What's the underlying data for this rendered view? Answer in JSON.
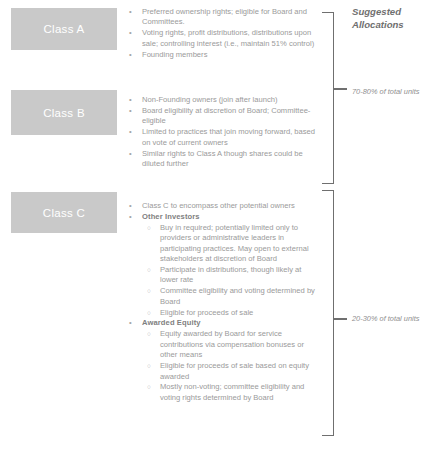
{
  "slide": {
    "title": "Equity Class Structure",
    "accent_color": "#c9c9c9",
    "text_color": "#9a9a9a",
    "bracket_color": "#6f6f6f"
  },
  "classes": [
    {
      "id": "class-a",
      "label": "Class A"
    },
    {
      "id": "class-b",
      "label": "Class B"
    },
    {
      "id": "class-c",
      "label": "Class C"
    }
  ],
  "class_a_bullets": [
    {
      "marker": "•",
      "level": 1,
      "bold": false,
      "text": "Preferred ownership rights; eligible for Board and Committees."
    },
    {
      "marker": "•",
      "level": 1,
      "bold": false,
      "text": "Voting rights, profit distributions, distributions upon sale; controlling interest (i.e., maintain 51% control)"
    },
    {
      "marker": "•",
      "level": 1,
      "bold": false,
      "text": "Founding members"
    }
  ],
  "class_b_bullets": [
    {
      "marker": "•",
      "level": 1,
      "bold": false,
      "text": "Non-Founding owners (join after launch)"
    },
    {
      "marker": "•",
      "level": 1,
      "bold": false,
      "text": "Board eligibility at discretion of Board; Committee-eligible"
    },
    {
      "marker": "•",
      "level": 1,
      "bold": false,
      "text": "Limited to practices that join moving forward, based on vote of current owners"
    },
    {
      "marker": "•",
      "level": 1,
      "bold": false,
      "text": "Similar rights to Class A though shares could be diluted further"
    }
  ],
  "class_c_bullets": [
    {
      "marker": "•",
      "level": 1,
      "bold": false,
      "text": "Class C to encompass other potential owners"
    },
    {
      "marker": "•",
      "level": 1,
      "bold": true,
      "text": "Other Investors"
    },
    {
      "marker": "○",
      "level": 2,
      "bold": false,
      "text": "Buy in required; potentially limited only to providers or administrative leaders in participating practices. May open to external stakeholders at discretion of Board"
    },
    {
      "marker": "○",
      "level": 2,
      "bold": false,
      "text": "Participate in distributions, though likely at lower rate"
    },
    {
      "marker": "○",
      "level": 2,
      "bold": false,
      "text": "Committee eligibility and voting determined by Board"
    },
    {
      "marker": "○",
      "level": 2,
      "bold": false,
      "text": "Eligible for proceeds of sale"
    },
    {
      "marker": "•",
      "level": 1,
      "bold": true,
      "text": "Awarded Equity"
    },
    {
      "marker": "○",
      "level": 2,
      "bold": false,
      "text": "Equity awarded by Board for service contributions via compensation bonuses or other means"
    },
    {
      "marker": "○",
      "level": 2,
      "bold": false,
      "text": "Eligible for proceeds of sale based on equity awarded"
    },
    {
      "marker": "○",
      "level": 2,
      "bold": false,
      "text": "Mostly non-voting; committee eligibility and voting rights determined by Board"
    }
  ],
  "allocations": {
    "heading": "Suggested Allocations",
    "top_label": "70-80% of total units",
    "bottom_label": "20-30% of total units"
  }
}
